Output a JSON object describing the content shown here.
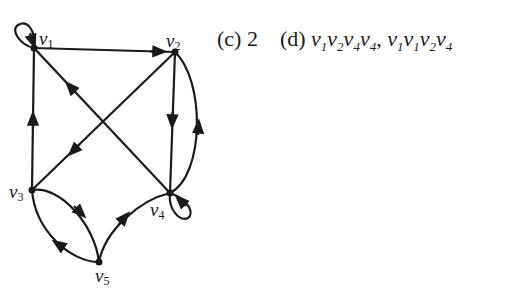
{
  "graph": {
    "nodes": [
      {
        "id": "v1",
        "label": "v",
        "sub": "1",
        "x": 34,
        "y": 48
      },
      {
        "id": "v2",
        "label": "v",
        "sub": "2",
        "x": 175,
        "y": 52
      },
      {
        "id": "v3",
        "label": "v",
        "sub": "3",
        "x": 32,
        "y": 190
      },
      {
        "id": "v4",
        "label": "v",
        "sub": "4",
        "x": 170,
        "y": 193
      },
      {
        "id": "v5",
        "label": "v",
        "sub": "5",
        "x": 99,
        "y": 262
      }
    ],
    "edges": [
      {
        "from": "v1",
        "to": "v1",
        "type": "loop"
      },
      {
        "from": "v1",
        "to": "v2"
      },
      {
        "from": "v3",
        "to": "v1"
      },
      {
        "from": "v4",
        "to": "v1"
      },
      {
        "from": "v2",
        "to": "v3"
      },
      {
        "from": "v2",
        "to": "v4"
      },
      {
        "from": "v4",
        "to": "v2",
        "type": "curved"
      },
      {
        "from": "v4",
        "to": "v4",
        "type": "loop"
      },
      {
        "from": "v3",
        "to": "v5",
        "type": "curved"
      },
      {
        "from": "v5",
        "to": "v3",
        "type": "curved"
      },
      {
        "from": "v5",
        "to": "v4",
        "type": "curved"
      }
    ]
  },
  "answers": {
    "c_label": "(c)",
    "c_value": "2",
    "d_label": "(d)",
    "d_paths": [
      "v1v2v4v4",
      "v1v1v2v4"
    ],
    "separator": ","
  }
}
